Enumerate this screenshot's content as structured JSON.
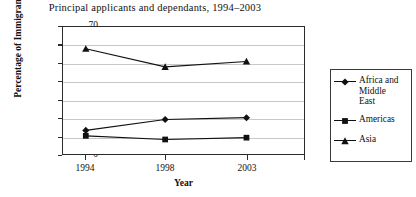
{
  "chart_data": {
    "type": "line",
    "title": "Principal applicants and dependants, 1994–2003",
    "xlabel": "Year",
    "ylabel": "Percentage of Immigrants",
    "categories": [
      "1994",
      "1998",
      "2003"
    ],
    "ylim": [
      0,
      70
    ],
    "ytick_labels": [
      "0",
      "10",
      "20",
      "30",
      "40",
      "50",
      "60",
      "70"
    ],
    "ytick_values": [
      0,
      10,
      20,
      30,
      40,
      50,
      60,
      70
    ],
    "grid": true,
    "legend_position": "right",
    "series": [
      {
        "name": "Africa and Middle East",
        "marker": "diamond",
        "values": [
          13,
          19,
          20
        ]
      },
      {
        "name": "Americas",
        "marker": "square",
        "values": [
          10,
          8,
          9
        ]
      },
      {
        "name": "Asia",
        "marker": "triangle",
        "values": [
          58,
          48,
          51
        ]
      }
    ],
    "colors": {
      "line": "#111111",
      "marker": "#111111",
      "grid": "#c8c8c8",
      "axis": "#2a2a2a",
      "background": "#ffffff"
    }
  },
  "legend": {
    "items": [
      {
        "label_line1": "Africa and",
        "label_line2": "Middle",
        "label_line3": "East",
        "marker": "diamond"
      },
      {
        "label_line1": "Americas",
        "label_line2": "",
        "label_line3": "",
        "marker": "square"
      },
      {
        "label_line1": "Asia",
        "label_line2": "",
        "label_line3": "",
        "marker": "triangle"
      }
    ]
  }
}
